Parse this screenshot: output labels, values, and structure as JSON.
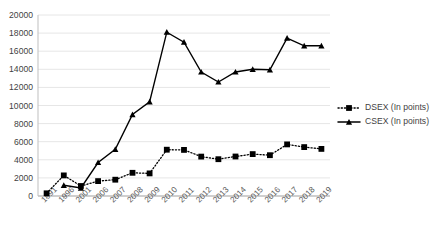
{
  "chart_data": {
    "type": "line",
    "title": "",
    "xlabel": "",
    "ylabel": "",
    "ylim": [
      0,
      20000
    ],
    "ytick_step": 2000,
    "yticks": [
      "0",
      "2000",
      "4000",
      "6000",
      "8000",
      "10000",
      "12000",
      "14000",
      "16000",
      "18000",
      "20000"
    ],
    "grid": true,
    "legend_position": "right",
    "categories": [
      "1991",
      "1996",
      "2001",
      "2006",
      "2007",
      "2008",
      "2009",
      "2010",
      "2011",
      "2012",
      "2013",
      "2014",
      "2015",
      "2016",
      "2017",
      "2018",
      "2019"
    ],
    "series": [
      {
        "name": "DSEX (In points)",
        "marker": "square",
        "line_style": "dotted",
        "color": "#000000",
        "values": [
          300,
          2280,
          1100,
          1650,
          1800,
          2560,
          2500,
          5120,
          5090,
          4350,
          4070,
          4370,
          4630,
          4510,
          5700,
          5400,
          5200
        ]
      },
      {
        "name": "CSEX (In points)",
        "marker": "triangle",
        "line_style": "solid",
        "color": "#000000",
        "values": [
          null,
          1180,
          880,
          3700,
          5150,
          9000,
          10400,
          18100,
          17000,
          13700,
          12600,
          13700,
          14000,
          13950,
          17450,
          16600,
          16600
        ]
      }
    ]
  },
  "legend": {
    "items": [
      {
        "label": "DSEX (In points)",
        "marker": "square",
        "style": "dotted"
      },
      {
        "label": "CSEX (In points)",
        "marker": "triangle",
        "style": "solid"
      }
    ]
  }
}
